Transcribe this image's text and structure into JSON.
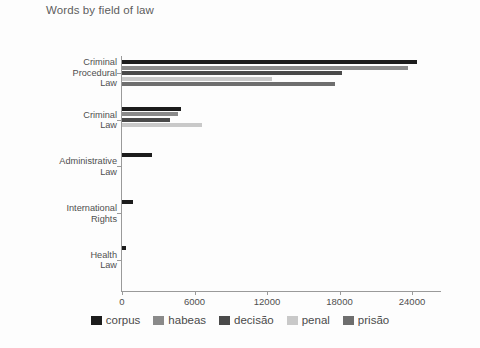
{
  "chart_data": {
    "type": "bar",
    "orientation": "horizontal",
    "title": "Words by field of law",
    "xlabel": "",
    "ylabel": "",
    "grid": false,
    "legend_position": "bottom",
    "xlim": [
      0,
      26000
    ],
    "xticks": [
      0,
      6000,
      12000,
      18000,
      24000
    ],
    "xtick_labels": [
      "0",
      "6000",
      "12000",
      "18000",
      "24000"
    ],
    "categories": [
      "Criminal\nProcedural\nLaw",
      "Criminal\nLaw",
      "Administrative\nLaw",
      "International\nRights",
      "Health\nLaw"
    ],
    "series": [
      {
        "name": "corpus",
        "color": "#1c1c1c",
        "values": [
          24400,
          4900,
          2500,
          900,
          350
        ]
      },
      {
        "name": "habeas",
        "color": "#8a8a8a",
        "values": [
          23700,
          4600,
          0,
          0,
          0
        ]
      },
      {
        "name": "decisão",
        "color": "#4a4a4a",
        "values": [
          18200,
          4000,
          0,
          0,
          0
        ]
      },
      {
        "name": "penal",
        "color": "#c9c9c9",
        "values": [
          12400,
          6600,
          0,
          0,
          0
        ]
      },
      {
        "name": "prisão",
        "color": "#6e6e6e",
        "values": [
          17600,
          0,
          0,
          0,
          0
        ]
      }
    ]
  },
  "legend": {
    "items": [
      {
        "label": "corpus",
        "color": "#1c1c1c"
      },
      {
        "label": "habeas",
        "color": "#8a8a8a"
      },
      {
        "label": "decisão",
        "color": "#4a4a4a"
      },
      {
        "label": "penal",
        "color": "#c9c9c9"
      },
      {
        "label": "prisão",
        "color": "#6e6e6e"
      }
    ]
  }
}
